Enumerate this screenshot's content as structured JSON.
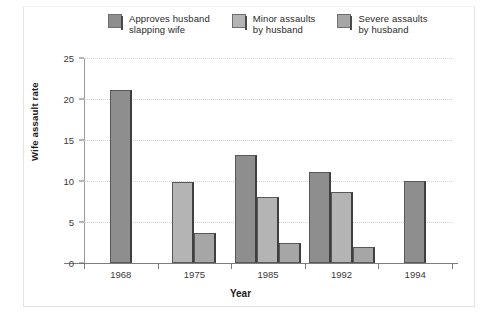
{
  "chart_data": {
    "type": "bar",
    "title": "",
    "subtitle": "",
    "xlabel": "Year",
    "ylabel": "Wife assault rate",
    "categories": [
      "1968",
      "1975",
      "1985",
      "1992",
      "1994"
    ],
    "ylim": [
      0,
      25
    ],
    "yticks": [
      0,
      5,
      10,
      15,
      20,
      25
    ],
    "grid": true,
    "legend_position": "top",
    "series": [
      {
        "name": "Approves husband\nslapping wife",
        "color": "#8e8e8e",
        "values": [
          21.1,
          null,
          13.2,
          11.1,
          10.0
        ]
      },
      {
        "name": "Minor assaults\nby husband",
        "color": "#b4b4b4",
        "values": [
          null,
          9.9,
          8.0,
          8.7,
          null
        ]
      },
      {
        "name": "Severe assaults\nby husband",
        "color": "#a6a6a6",
        "values": [
          null,
          3.7,
          2.4,
          2.0,
          null
        ]
      }
    ]
  },
  "colors": {
    "background": "#ffffff",
    "axis": "#7d7d7d",
    "grid": "#cfcfcf",
    "text": "#2b2b2b",
    "frame": "#e3e3e3"
  }
}
